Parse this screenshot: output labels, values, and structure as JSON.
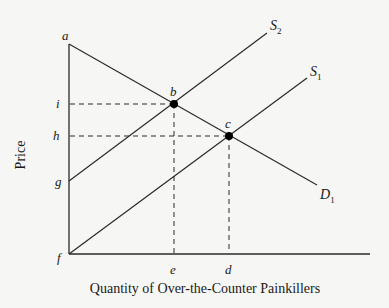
{
  "diagram": {
    "type": "supply-demand",
    "x_axis_title": "Quantity of Over-the-Counter Painkillers",
    "y_axis_title": "Price",
    "colors": {
      "line": "#2a2a2a",
      "background": "#f6f6f4",
      "point": "#000000"
    },
    "curves": [
      {
        "id": "D1",
        "label": "D",
        "subscript": "1",
        "from": [
          69,
          44
        ],
        "to": [
          317,
          185
        ]
      },
      {
        "id": "S2",
        "label": "S",
        "subscript": "2",
        "from": [
          69,
          181
        ],
        "to": [
          267,
          33
        ]
      },
      {
        "id": "S1",
        "label": "S",
        "subscript": "1",
        "from": [
          69,
          254
        ],
        "to": [
          307,
          78
        ]
      }
    ],
    "points": [
      {
        "id": "a",
        "label": "a"
      },
      {
        "id": "b",
        "label": "b"
      },
      {
        "id": "c",
        "label": "c"
      },
      {
        "id": "d",
        "label": "d"
      },
      {
        "id": "e",
        "label": "e"
      },
      {
        "id": "f",
        "label": "f"
      },
      {
        "id": "g",
        "label": "g"
      },
      {
        "id": "h",
        "label": "h"
      },
      {
        "id": "i",
        "label": "i"
      }
    ],
    "equilibria": [
      {
        "id": "b",
        "price_label": "i",
        "quantity_label": "e",
        "curves": [
          "S2",
          "D1"
        ]
      },
      {
        "id": "c",
        "price_label": "h",
        "quantity_label": "d",
        "curves": [
          "S1",
          "D1"
        ]
      }
    ]
  }
}
